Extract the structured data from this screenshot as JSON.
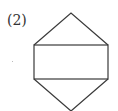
{
  "figure": {
    "label": "(2)",
    "shape": "rectangle with triangles on top and bottom (hexagon-like net)",
    "stroke_color": "#3a3a3a",
    "vertices": {
      "top_apex": [
        71,
        13
      ],
      "rect_top_left": [
        34,
        45
      ],
      "rect_top_right": [
        108,
        45
      ],
      "rect_bottom_left": [
        34,
        79
      ],
      "rect_bottom_right": [
        108,
        79
      ],
      "bottom_apex": [
        71,
        111
      ]
    }
  }
}
